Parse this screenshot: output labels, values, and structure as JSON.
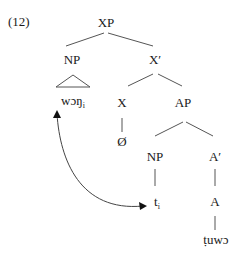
{
  "example_number": "(12)",
  "tree": {
    "root": "XP",
    "spec": "NP",
    "bar": "X′",
    "head": "X",
    "head_content": "Ø",
    "complement": "AP",
    "ap_spec": "NP",
    "ap_bar": "A′",
    "ap_head": "A",
    "moved_word": "wɔŋ",
    "moved_index": "i",
    "trace": "t",
    "trace_index": "i",
    "adjective": "ṭuwɔ"
  },
  "colors": {
    "lines": "#555555",
    "text": "#1a1a1a"
  }
}
